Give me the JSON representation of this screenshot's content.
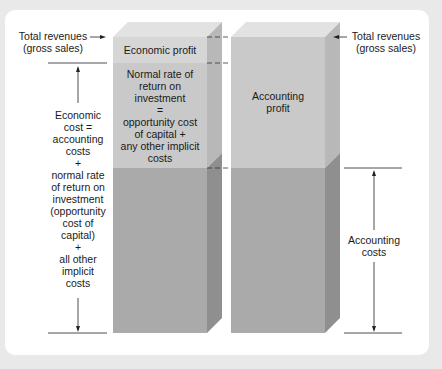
{
  "labels": {
    "left_top": [
      "Total revenues",
      "(gross sales)"
    ],
    "right_top": [
      "Total revenues",
      "(gross sales)"
    ],
    "economic_cost": [
      "Economic",
      "cost =",
      "accounting",
      "costs",
      "+",
      "normal rate",
      "of return on",
      "investment",
      "(opportunity",
      "cost of",
      "capital)",
      "+",
      "all other",
      "implicit",
      "costs"
    ],
    "accounting_costs": [
      "Accounting",
      "costs"
    ]
  },
  "bars": {
    "economic": {
      "segments": [
        {
          "name": "economic-profit",
          "text": [
            "Economic profit"
          ],
          "color": "#d6d6d6"
        },
        {
          "name": "normal-return",
          "text": [
            "Normal rate of",
            "return on",
            "investment",
            "=",
            "opportunity cost",
            "of capital +",
            "any other implicit",
            "costs"
          ],
          "color": "#c9c9c9"
        },
        {
          "name": "economic-costs",
          "text": [],
          "color": "#aaaaaa"
        }
      ]
    },
    "accounting": {
      "segments": [
        {
          "name": "accounting-profit",
          "text": [
            "Accounting",
            "profit"
          ],
          "color": "#c9c9c9"
        },
        {
          "name": "accounting-costs",
          "text": [],
          "color": "#aaaaaa"
        }
      ]
    }
  },
  "colors": {
    "background": "#e9e9e9",
    "panel": "#ffffff",
    "top_face": "#e2e2e2",
    "side_face_light": "#b5b5b5",
    "side_face_dark": "#8f8f8f",
    "line": "#222222"
  }
}
